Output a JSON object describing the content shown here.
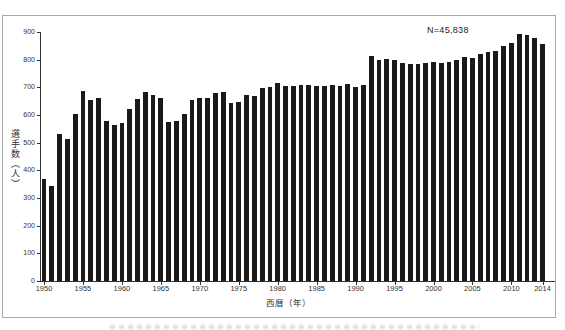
{
  "chart_data": {
    "type": "bar",
    "title": "",
    "annotation": "N=45,838",
    "xlabel": "西暦（年）",
    "ylabel": "選手数（人）",
    "ylim": [
      0,
      900
    ],
    "ytick_step": 100,
    "grid": false,
    "legend": false,
    "bar_color": "#1a1a1a",
    "axis_color": "#333333",
    "text_color": "#333333",
    "border_color": "#a9a9a9",
    "xtick_labels": [
      1950,
      1955,
      1960,
      1965,
      1970,
      1975,
      1980,
      1985,
      1990,
      1995,
      2000,
      2005,
      2010,
      2014
    ],
    "x": [
      1950,
      1951,
      1952,
      1953,
      1954,
      1955,
      1956,
      1957,
      1958,
      1959,
      1960,
      1961,
      1962,
      1963,
      1964,
      1965,
      1966,
      1967,
      1968,
      1969,
      1970,
      1971,
      1972,
      1973,
      1974,
      1975,
      1976,
      1977,
      1978,
      1979,
      1980,
      1981,
      1982,
      1983,
      1984,
      1985,
      1986,
      1987,
      1988,
      1989,
      1990,
      1991,
      1992,
      1993,
      1994,
      1995,
      1996,
      1997,
      1998,
      1999,
      2000,
      2001,
      2002,
      2003,
      2004,
      2005,
      2006,
      2007,
      2008,
      2009,
      2010,
      2011,
      2012,
      2013,
      2014
    ],
    "values": [
      367,
      342,
      532,
      512,
      602,
      687,
      654,
      662,
      579,
      564,
      570,
      621,
      657,
      682,
      672,
      661,
      575,
      579,
      605,
      654,
      663,
      662,
      678,
      682,
      643,
      648,
      673,
      667,
      697,
      703,
      715,
      706,
      706,
      710,
      710,
      706,
      704,
      707,
      706,
      711,
      702,
      707,
      813,
      797,
      804,
      797,
      789,
      785,
      786,
      787,
      793,
      788,
      793,
      800,
      810,
      805,
      820,
      829,
      832,
      849,
      860,
      894,
      889,
      879,
      856
    ],
    "total_n": 45838
  }
}
